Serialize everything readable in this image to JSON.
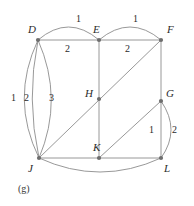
{
  "figure": {
    "caption": "(g)",
    "stroke_color": "#8c8c8c",
    "vertex_color": "#6e6e6e",
    "text_color": "#2b2b2b",
    "background": "#ffffff"
  },
  "vertices": [
    {
      "id": "D",
      "label": "D",
      "x": 38,
      "y": 40,
      "lx": 28,
      "ly": 24
    },
    {
      "id": "E",
      "label": "E",
      "x": 99,
      "y": 40,
      "lx": 93,
      "ly": 24
    },
    {
      "id": "F",
      "label": "F",
      "x": 161,
      "y": 40,
      "lx": 167,
      "ly": 24
    },
    {
      "id": "H",
      "label": "H",
      "x": 99,
      "y": 99,
      "lx": 85,
      "ly": 88
    },
    {
      "id": "G",
      "label": "G",
      "x": 161,
      "y": 101,
      "lx": 166,
      "ly": 88
    },
    {
      "id": "J",
      "label": "J",
      "x": 39,
      "y": 158,
      "lx": 28,
      "ly": 163
    },
    {
      "id": "K",
      "label": "K",
      "x": 99,
      "y": 158,
      "lx": 93,
      "ly": 142
    },
    {
      "id": "L",
      "label": "L",
      "x": 161,
      "y": 158,
      "lx": 164,
      "ly": 163
    }
  ],
  "edges": [
    {
      "name": "edge-D-E-arc",
      "from": "D",
      "to": "E",
      "kind": "arc",
      "path": "M38,40 Q68.5,14 99,40"
    },
    {
      "name": "edge-D-E-line",
      "from": "D",
      "to": "E",
      "kind": "straight",
      "path": "M38,40 L99,40"
    },
    {
      "name": "edge-E-F-arc",
      "from": "E",
      "to": "F",
      "kind": "arc",
      "path": "M99,40 Q130,14 161,40"
    },
    {
      "name": "edge-E-F-line",
      "from": "E",
      "to": "F",
      "kind": "straight",
      "path": "M99,40 L161,40"
    },
    {
      "name": "edge-D-J-arc-left",
      "from": "D",
      "to": "J",
      "kind": "arc",
      "path": "M38,40 Q10,99 39,158"
    },
    {
      "name": "edge-D-J-arc-mid",
      "from": "D",
      "to": "J",
      "kind": "arc",
      "path": "M38,40 Q26,99 39,158"
    },
    {
      "name": "edge-D-J-arc-right",
      "from": "D",
      "to": "J",
      "kind": "arc",
      "path": "M38,40 Q64,99 39,158"
    },
    {
      "name": "edge-E-H",
      "from": "E",
      "to": "H",
      "kind": "straight",
      "path": "M99,40 L99,99"
    },
    {
      "name": "edge-H-K",
      "from": "H",
      "to": "K",
      "kind": "straight",
      "path": "M99,99 L99,158"
    },
    {
      "name": "edge-F-G",
      "from": "F",
      "to": "G",
      "kind": "straight",
      "path": "M161,40 L161,101"
    },
    {
      "name": "edge-G-L",
      "from": "G",
      "to": "L",
      "kind": "straight",
      "path": "M161,101 L161,158"
    },
    {
      "name": "edge-G-L-arc",
      "from": "G",
      "to": "L",
      "kind": "arc",
      "path": "M161,101 Q181,130 161,158"
    },
    {
      "name": "edge-J-K",
      "from": "J",
      "to": "K",
      "kind": "straight",
      "path": "M39,158 L99,158"
    },
    {
      "name": "edge-K-L",
      "from": "K",
      "to": "L",
      "kind": "straight",
      "path": "M99,158 L161,158"
    },
    {
      "name": "edge-J-L-arc",
      "from": "J",
      "to": "L",
      "kind": "arc",
      "path": "M39,158 Q100,186 161,158"
    },
    {
      "name": "edge-J-H-F",
      "from": "J",
      "to": "F",
      "kind": "straight",
      "path": "M39,158 L161,40"
    },
    {
      "name": "edge-K-G",
      "from": "K",
      "to": "G",
      "kind": "straight",
      "path": "M99,158 L161,101"
    }
  ],
  "edge_labels": [
    {
      "name": "weight-D-E-arc",
      "text": "1",
      "x": 76,
      "y": 14
    },
    {
      "name": "weight-E-F-arc",
      "text": "1",
      "x": 133,
      "y": 14
    },
    {
      "name": "weight-D-E-line",
      "text": "2",
      "x": 65,
      "y": 44
    },
    {
      "name": "weight-E-F-line",
      "text": "2",
      "x": 125,
      "y": 44
    },
    {
      "name": "weight-D-J-1",
      "text": "1",
      "x": 11,
      "y": 93
    },
    {
      "name": "weight-D-J-2",
      "text": "2",
      "x": 24,
      "y": 93
    },
    {
      "name": "weight-D-J-3",
      "text": "3",
      "x": 49,
      "y": 93
    },
    {
      "name": "weight-G-L-line",
      "text": "1",
      "x": 149,
      "y": 125
    },
    {
      "name": "weight-G-L-arc",
      "text": "2",
      "x": 172,
      "y": 125
    }
  ]
}
